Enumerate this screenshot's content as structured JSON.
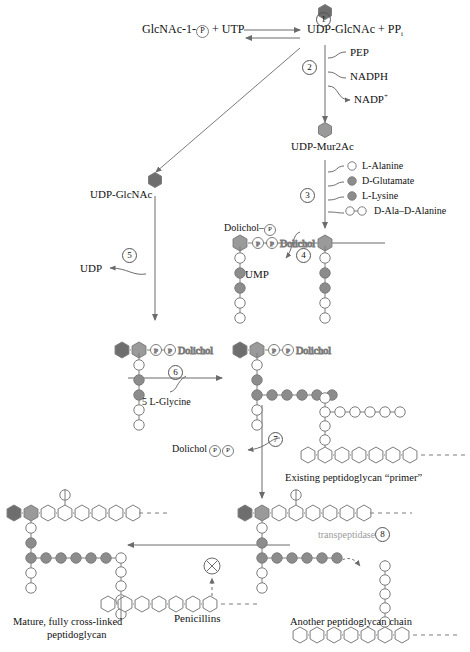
{
  "colors": {
    "glcnac_dark": "#6e6e6e",
    "mur2ac_mid": "#9a9a9a",
    "residue_dark": "#8c8c8c",
    "residue_light": "#ffffff",
    "outline": "#7d7d7d",
    "line": "#6b6b6b",
    "text": "#111111",
    "faded_text": "#9b9b9b"
  },
  "top_reaction": {
    "left_label": "GlcNAc-1-",
    "left_phosphate": "P",
    "left_plus_utp": " + UTP",
    "right_label": "UDP-GlcNAc + PP",
    "right_subscript": "i",
    "step": "1"
  },
  "steps": {
    "s1": "1",
    "s2": "2",
    "s3": "3",
    "s4": "4",
    "s5": "5",
    "s6": "6",
    "s7": "7",
    "s8": "8"
  },
  "step2": {
    "cofactor_1": "PEP",
    "cofactor_2": "NADPH",
    "product": "NADP",
    "product_charge": "+",
    "output_label": "UDP-Mur2Ac"
  },
  "step3": {
    "residues": [
      {
        "name": "L-Alanine",
        "fill": "light",
        "double": false
      },
      {
        "name": "D-Glutamate",
        "fill": "dark",
        "double": false
      },
      {
        "name": "L-Lysine",
        "fill": "dark",
        "double": false
      },
      {
        "name": "D-Ala–D-Alanine",
        "fill": "light",
        "double": true
      }
    ]
  },
  "step4": {
    "input": "Dolichol–",
    "input_phosphate": "P",
    "output": "UMP"
  },
  "step5": {
    "node_label": "UDP-GlcNAc",
    "output": "UDP"
  },
  "step6": {
    "cofactor": "5 L-Glycine",
    "glycine_count": 5
  },
  "step7": {
    "output": "Dolichol",
    "output_p1": "P",
    "output_p2": "P",
    "primer_label": "Existing peptidoglycan “primer”"
  },
  "step8": {
    "enzyme": "transpeptidase",
    "inhibitor": "Penicillins",
    "inhibit_symbol": "⊗"
  },
  "labels": {
    "dolichol": "Dolichol",
    "phosphate": "P",
    "mature_line1": "Mature, fully cross-linked",
    "mature_line2": "peptidoglycan",
    "another_chain": "Another peptidoglycan chain"
  },
  "chains": {
    "lipid_ii_pentapeptide": [
      "light",
      "dark",
      "dark",
      "light",
      "light"
    ],
    "mature_backbone_count": 7,
    "another_backbone_count": 7,
    "primer_backbone_count": 7,
    "primer_glycine_count": 5
  }
}
